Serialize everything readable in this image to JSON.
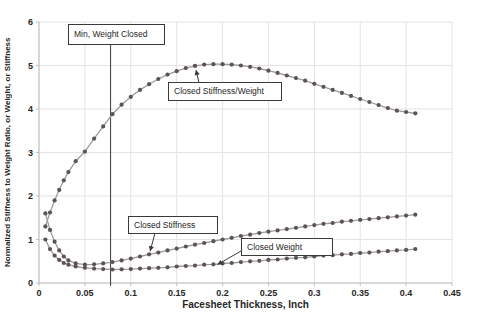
{
  "colors": {
    "grid": "#e3e3e3",
    "axis": "#bfbfbf",
    "line": "#9c9c9c",
    "marker": "#5d5353",
    "annotation": "#3a3a3a",
    "text": "#262626"
  },
  "chart_data": {
    "type": "line",
    "title": "",
    "xlabel": "Facesheet Thickness, Inch",
    "ylabel": "Normalized Stiffness to Weight Ratio, or Weight, or Stiffness",
    "xlim": [
      0,
      0.45
    ],
    "ylim": [
      0,
      6
    ],
    "grid": true,
    "legend": "none (inline callout labels)",
    "x_ticks": [
      "0",
      "0.05",
      "0.1",
      "0.15",
      "0.2",
      "0.25",
      "0.3",
      "0.35",
      "0.4",
      "0.45"
    ],
    "y_ticks": [
      "0",
      "1",
      "2",
      "3",
      "4",
      "5",
      "6"
    ],
    "x": [
      0.007,
      0.012,
      0.017,
      0.022,
      0.027,
      0.032,
      0.04,
      0.05,
      0.06,
      0.07,
      0.08,
      0.09,
      0.1,
      0.11,
      0.12,
      0.13,
      0.14,
      0.15,
      0.16,
      0.17,
      0.18,
      0.19,
      0.2,
      0.21,
      0.22,
      0.23,
      0.24,
      0.25,
      0.26,
      0.27,
      0.28,
      0.29,
      0.3,
      0.31,
      0.32,
      0.33,
      0.34,
      0.35,
      0.36,
      0.37,
      0.38,
      0.39,
      0.4,
      0.41
    ],
    "series": [
      {
        "name": "Closed Stiffness/Weight",
        "values": [
          1.3,
          1.62,
          1.9,
          2.14,
          2.36,
          2.55,
          2.8,
          3.02,
          3.32,
          3.6,
          3.88,
          4.1,
          4.28,
          4.44,
          4.57,
          4.69,
          4.79,
          4.87,
          4.94,
          4.99,
          5.02,
          5.03,
          5.03,
          5.02,
          5.0,
          4.97,
          4.93,
          4.88,
          4.83,
          4.77,
          4.71,
          4.65,
          4.58,
          4.51,
          4.44,
          4.37,
          4.3,
          4.23,
          4.16,
          4.09,
          4.02,
          3.96,
          3.93,
          3.9
        ]
      },
      {
        "name": "Closed Stiffness",
        "values": [
          1.6,
          1.22,
          0.95,
          0.75,
          0.61,
          0.52,
          0.45,
          0.42,
          0.43,
          0.45,
          0.48,
          0.52,
          0.56,
          0.61,
          0.66,
          0.7,
          0.75,
          0.79,
          0.84,
          0.88,
          0.92,
          0.96,
          1.0,
          1.04,
          1.08,
          1.11,
          1.15,
          1.18,
          1.21,
          1.24,
          1.27,
          1.3,
          1.33,
          1.36,
          1.38,
          1.41,
          1.43,
          1.45,
          1.47,
          1.49,
          1.51,
          1.53,
          1.55,
          1.57
        ]
      },
      {
        "name": "Closed Weight",
        "values": [
          1.0,
          0.78,
          0.63,
          0.53,
          0.46,
          0.42,
          0.38,
          0.35,
          0.33,
          0.32,
          0.31,
          0.315,
          0.32,
          0.33,
          0.34,
          0.35,
          0.36,
          0.38,
          0.39,
          0.4,
          0.42,
          0.43,
          0.45,
          0.46,
          0.48,
          0.5,
          0.51,
          0.53,
          0.54,
          0.56,
          0.58,
          0.59,
          0.61,
          0.63,
          0.64,
          0.66,
          0.67,
          0.69,
          0.7,
          0.72,
          0.73,
          0.75,
          0.76,
          0.78
        ]
      }
    ],
    "annotations": [
      {
        "label": "Min, Weight Closed",
        "type": "vline",
        "x": 0.078
      },
      {
        "label": "Closed Stiffness/Weight",
        "type": "callout",
        "points_to": {
          "x": 0.17,
          "y": 4.99
        }
      },
      {
        "label": "Closed Stiffness",
        "type": "callout",
        "points_to": {
          "x": 0.12,
          "y": 0.66
        }
      },
      {
        "label": "Closed Weight",
        "type": "callout",
        "points_to": {
          "x": 0.19,
          "y": 0.4
        }
      }
    ]
  }
}
